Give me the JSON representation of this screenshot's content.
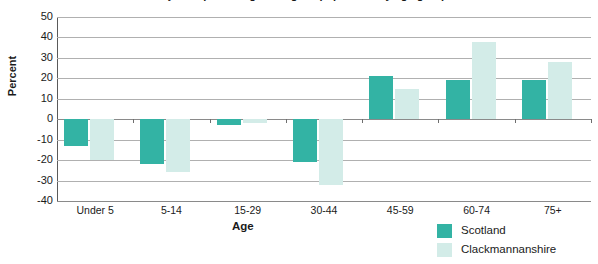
{
  "chart_data": {
    "type": "bar",
    "title": "Projected percentage change in population by age group",
    "xlabel": "Age",
    "ylabel": "Percent",
    "ylim": [
      -40,
      50
    ],
    "ytick_step": 10,
    "yticks": [
      50,
      40,
      30,
      20,
      10,
      0,
      -10,
      -20,
      -30,
      -40
    ],
    "grid": true,
    "legend_position": "bottom-right",
    "categories": [
      "Under 5",
      "5-14",
      "15-29",
      "30-44",
      "45-59",
      "60-74",
      "75+"
    ],
    "series": [
      {
        "name": "Scotland",
        "color": "#33b3a4",
        "values": [
          -13,
          -22,
          -3,
          -21,
          21,
          19,
          19
        ]
      },
      {
        "name": "Clackmannanshire",
        "color": "#d3ece8",
        "values": [
          -20,
          -26,
          -2,
          -32,
          15,
          38,
          28
        ]
      }
    ]
  },
  "colors": {
    "scotland": "#33b3a4",
    "clackmannanshire": "#d3ece8",
    "gridline": "#b0b0b0",
    "axis": "#5a5a5a",
    "text": "#1a1a1a",
    "background": "#ffffff"
  }
}
